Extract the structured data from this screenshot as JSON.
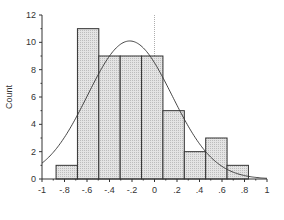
{
  "chart_data": {
    "type": "bar",
    "subtype": "histogram_with_normal_curve",
    "title": "",
    "xlabel": "",
    "ylabel": "Count",
    "xlim": [
      -1,
      1
    ],
    "ylim": [
      0,
      12
    ],
    "x_ticks": [
      -1,
      -0.8,
      -0.6,
      -0.4,
      -0.2,
      0,
      0.2,
      0.4,
      0.6,
      0.8,
      1
    ],
    "x_tick_labels": [
      "-1",
      "-.8",
      "-.6",
      "-.4",
      "-.2",
      "0",
      ".2",
      ".4",
      ".6",
      ".8",
      "1"
    ],
    "y_ticks": [
      0,
      2,
      4,
      6,
      8,
      10,
      12
    ],
    "y_tick_labels": [
      "0",
      "2",
      "4",
      "6",
      "8",
      "10",
      "12"
    ],
    "bin_edges": [
      -0.875,
      -0.685,
      -0.495,
      -0.305,
      -0.115,
      0.075,
      0.265,
      0.455,
      0.645,
      0.835
    ],
    "counts": [
      1,
      11,
      9,
      9,
      9,
      5,
      2,
      3,
      1
    ],
    "normal_curve": {
      "mean": -0.22,
      "sd": 0.375,
      "peak": 10.1
    },
    "reference_line": {
      "x": 0,
      "style": "dotted"
    },
    "grid": false,
    "legend": null,
    "colors": {
      "bar_fill": "#d9d9d9",
      "bar_stroke": "#333333",
      "curve": "#333333",
      "axis": "#333333",
      "ref_line": "#999999"
    }
  }
}
